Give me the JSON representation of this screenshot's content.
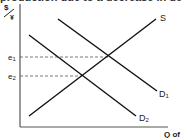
{
  "top_cutoff_text": "production due to a decrease in demand",
  "diagram": {
    "type": "supply-demand",
    "y_axis_label_top": "$",
    "y_axis_label_bottom": "¥",
    "x_axis_label": "Q of",
    "curves": [
      {
        "name": "S",
        "label": "S",
        "x1": 29,
        "y1": 116,
        "x2": 156,
        "y2": 19
      },
      {
        "name": "D1",
        "label": "D",
        "sub": "1",
        "x1": 58,
        "y1": 19,
        "x2": 157,
        "y2": 91
      },
      {
        "name": "D2",
        "label": "D",
        "sub": "2",
        "x1": 29,
        "y1": 35,
        "x2": 136,
        "y2": 116
      }
    ],
    "equilibria": [
      {
        "label": "e",
        "sub": "1",
        "x": 108,
        "y": 57
      },
      {
        "label": "e",
        "sub": "2",
        "x": 82,
        "y": 76
      }
    ],
    "colors": {
      "line": "#111111",
      "dash": "#555555",
      "axis": "#555555"
    }
  }
}
